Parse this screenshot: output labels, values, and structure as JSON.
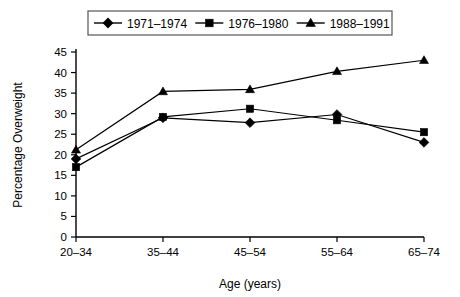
{
  "chart_data": {
    "type": "line",
    "title": "",
    "xlabel": "Age (years)",
    "ylabel": "Percentage Overweight",
    "categories": [
      "20–34",
      "35–44",
      "45–54",
      "55–64",
      "65–74"
    ],
    "ylim": [
      0,
      45
    ],
    "yticks": [
      0,
      5,
      10,
      15,
      20,
      25,
      30,
      35,
      40,
      45
    ],
    "ytick_labels": [
      "0",
      "5",
      "10",
      "15",
      "20",
      "25",
      "30",
      "35",
      "40",
      "45"
    ],
    "grid": false,
    "legend_position": "top-center",
    "series": [
      {
        "name": "1971–1974",
        "marker": "diamond",
        "color": "#000000",
        "values": [
          19,
          29,
          27.8,
          29.8,
          23
        ]
      },
      {
        "name": "1976–1980",
        "marker": "square",
        "color": "#000000",
        "values": [
          17,
          29.2,
          31.2,
          28.4,
          25.5
        ]
      },
      {
        "name": "1988–1991",
        "marker": "triangle",
        "color": "#000000",
        "values": [
          21.2,
          35.4,
          35.9,
          40.3,
          43
        ]
      }
    ]
  },
  "legend": {
    "entries": [
      {
        "label": "1971–1974",
        "marker": "diamond"
      },
      {
        "label": "1976–1980",
        "marker": "square"
      },
      {
        "label": "1988–1991",
        "marker": "triangle"
      }
    ]
  },
  "axes": {
    "x_title": "Age (years)",
    "y_title": "Percentage Overweight"
  }
}
